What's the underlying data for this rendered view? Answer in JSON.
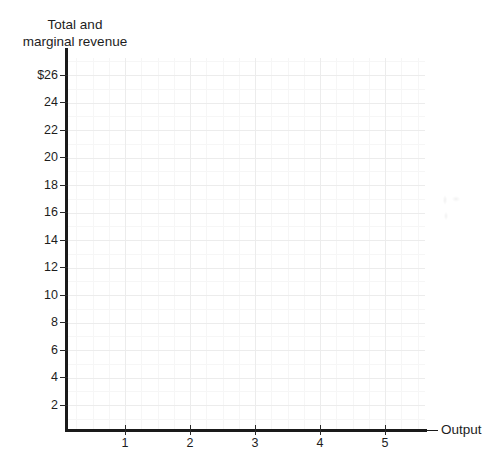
{
  "chart_data": {
    "type": "line",
    "title": "",
    "ylabel": "Total and\nmarginal revenue",
    "xlabel": "Output",
    "ylim": [
      0,
      27
    ],
    "xlim": [
      0,
      5.5
    ],
    "grid": true,
    "legend_position": "none",
    "series": [],
    "annotations": [],
    "y_ticks": [
      {
        "value": 26,
        "label": "$26"
      },
      {
        "value": 24,
        "label": "24"
      },
      {
        "value": 22,
        "label": "22"
      },
      {
        "value": 20,
        "label": "20"
      },
      {
        "value": 18,
        "label": "18"
      },
      {
        "value": 16,
        "label": "16"
      },
      {
        "value": 14,
        "label": "14"
      },
      {
        "value": 12,
        "label": "12"
      },
      {
        "value": 10,
        "label": "10"
      },
      {
        "value": 8,
        "label": "8"
      },
      {
        "value": 6,
        "label": "6"
      },
      {
        "value": 4,
        "label": "4"
      },
      {
        "value": 2,
        "label": "2"
      }
    ],
    "x_ticks": [
      {
        "value": 1,
        "label": "1"
      },
      {
        "value": 2,
        "label": "2"
      },
      {
        "value": 3,
        "label": "3"
      },
      {
        "value": 4,
        "label": "4"
      },
      {
        "value": 5,
        "label": "5"
      }
    ],
    "colors": {
      "axis": "#1a1a1a",
      "text": "#1d1d1d",
      "grid_major": "#ececec",
      "grid_minor": "#f6f6f6",
      "background": "#ffffff"
    }
  }
}
